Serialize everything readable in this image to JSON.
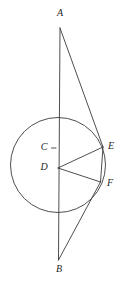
{
  "figure": {
    "type": "euclidean-plane-figure",
    "stroke_color": "#3a3a3a",
    "label_color": "#1f1f1f",
    "background_color": "#ffffff",
    "labels": {
      "A": "A",
      "B": "B",
      "C": "C",
      "D": "D",
      "E": "E",
      "F": "F"
    },
    "points": {
      "A": {
        "x": 60,
        "y": 28
      },
      "B": {
        "x": 58.5,
        "y": 260
      },
      "C": {
        "x": 58,
        "y": 148
      },
      "D": {
        "x": 58,
        "y": 168
      },
      "E": {
        "x": 103,
        "y": 147
      },
      "F": {
        "x": 100.5,
        "y": 182
      }
    },
    "label_positions": {
      "A": {
        "x": 60,
        "y": 14
      },
      "B": {
        "x": 59,
        "y": 270
      },
      "C": {
        "x": 44,
        "y": 148
      },
      "D": {
        "x": 44,
        "y": 168
      },
      "E": {
        "x": 111,
        "y": 147
      },
      "F": {
        "x": 110,
        "y": 184
      }
    },
    "circle": {
      "cx": 58,
      "cy": 165,
      "r": 47.5
    },
    "tick": {
      "x1": 51.5,
      "y1": 148,
      "x2": 56,
      "y2": 148
    },
    "segments": [
      {
        "name": "segment-AB",
        "from": "A",
        "to": "B"
      },
      {
        "name": "segment-AE",
        "from": "A",
        "to": "E"
      },
      {
        "name": "segment-EF",
        "from": "E",
        "to": "F"
      },
      {
        "name": "segment-FB",
        "from": "F",
        "to": "B"
      },
      {
        "name": "segment-DE",
        "from": "D",
        "to": "E"
      },
      {
        "name": "segment-DF",
        "from": "D",
        "to": "F"
      }
    ]
  }
}
